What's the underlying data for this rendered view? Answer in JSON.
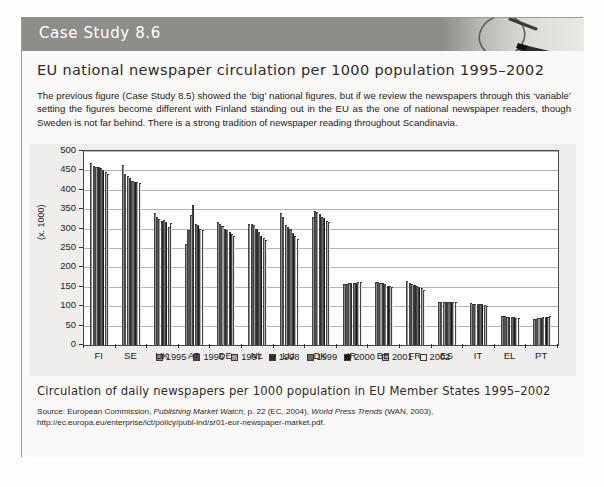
{
  "header": {
    "title": "Case Study 8.6",
    "icon": "magnifier-icon",
    "band_color": "#8d8d8a"
  },
  "figure": {
    "title": "EU national newspaper circulation per 1000 population 1995–2002",
    "intro": "The previous figure (Case Study 8.5) showed the ‘big’ national figures, but if we review the newspapers through this ‘variable’ setting the figures become different with Finland standing out in the EU as the one of national newspaper readers, though Sweden is not far behind. There is a strong tradition of newspaper reading throughout Scandinavia.",
    "caption": "Circulation of daily newspapers per 1000 population in EU Member States 1995–2002",
    "source_prefix": "Source: European Commission, ",
    "source_italic_1": "Publishing Market Watch",
    "source_mid": ", p. 22 (EC, 2004), ",
    "source_italic_2": "World Press Trends",
    "source_suffix": " (WAN, 2003), http://ec.europa.eu/enterprise/ict/policy/publ-ind/sr01-eur-newspaper-market.pdf."
  },
  "chart_data": {
    "type": "bar",
    "title": "",
    "xlabel": "",
    "ylabel": "(x. 1000)",
    "ylim": [
      0,
      500
    ],
    "ytick_step": 50,
    "yticks": [
      0,
      50,
      100,
      150,
      200,
      250,
      300,
      350,
      400,
      450,
      500
    ],
    "grid": true,
    "legend_position": "bottom",
    "categories": [
      "FI",
      "SE",
      "UK",
      "AT",
      "DE",
      "NL",
      "LU",
      "DK",
      "IR",
      "BE",
      "FR",
      "ES",
      "IT",
      "EL",
      "PT"
    ],
    "series": [
      {
        "name": "1995",
        "color": "#8f8f8f",
        "values": [
          470,
          465,
          341,
          260,
          316,
          312,
          341,
          330,
          158,
          163,
          165,
          110,
          107,
          76,
          68
        ]
      },
      {
        "name": "1996",
        "color": "#535353",
        "values": [
          461,
          441,
          331,
          297,
          311,
          311,
          330,
          345,
          158,
          162,
          160,
          110,
          106,
          75,
          67
        ]
      },
      {
        "name": "1997",
        "color": "#9e9e9e",
        "values": [
          458,
          436,
          326,
          334,
          306,
          310,
          310,
          342,
          160,
          160,
          158,
          110,
          105,
          73,
          70
        ]
      },
      {
        "name": "1998",
        "color": "#2e2e2e",
        "values": [
          458,
          430,
          320,
          360,
          300,
          300,
          304,
          337,
          160,
          160,
          155,
          110,
          105,
          72,
          70
        ]
      },
      {
        "name": "1999",
        "color": "#6a6a6a",
        "values": [
          455,
          424,
          322,
          311,
          296,
          290,
          298,
          330,
          160,
          157,
          152,
          110,
          105,
          71,
          71
        ]
      },
      {
        "name": "2000",
        "color": "#161616",
        "values": [
          452,
          420,
          316,
          310,
          292,
          281,
          288,
          327,
          161,
          153,
          150,
          110,
          105,
          71,
          72
        ]
      },
      {
        "name": "2001",
        "color": "#b4b4b4",
        "values": [
          445,
          419,
          303,
          300,
          286,
          276,
          280,
          320,
          162,
          151,
          146,
          110,
          103,
          70,
          73
        ]
      },
      {
        "name": "2002",
        "color": "#e8e8e8",
        "values": [
          441,
          418,
          314,
          297,
          281,
          271,
          272,
          318,
          163,
          150,
          143,
          110,
          101,
          70,
          74
        ]
      }
    ]
  }
}
